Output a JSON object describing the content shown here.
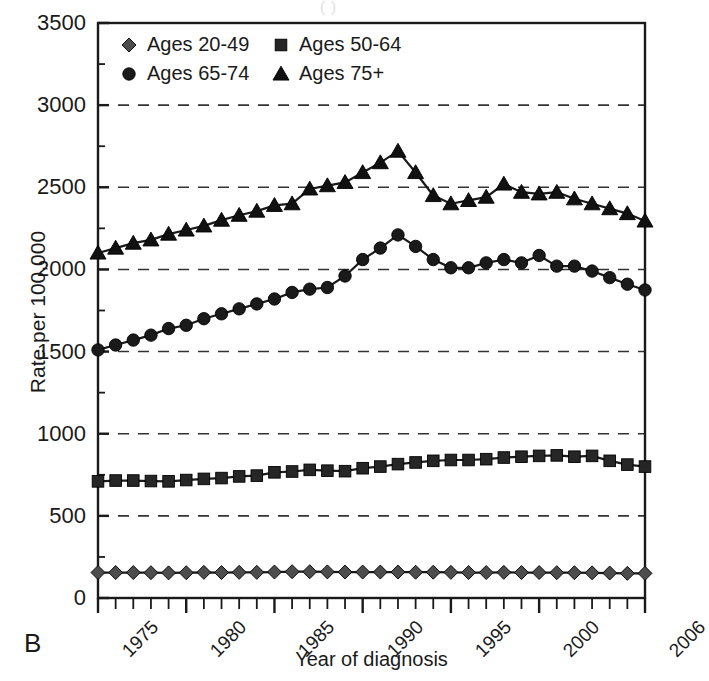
{
  "panel": {
    "label": "B",
    "ghost_title_fragment": "(              )"
  },
  "axes": {
    "x_title": "Year of diagnosis",
    "y_title": "Rate per 100,000",
    "y_ticks": [
      "0",
      "500",
      "1000",
      "1500",
      "2000",
      "2500",
      "3000",
      "3500"
    ],
    "x_ticks": [
      "1975",
      "1980",
      "1985",
      "1990",
      "1995",
      "2000",
      "2006"
    ]
  },
  "legend": {
    "items": [
      {
        "label": "Ages 20-49",
        "marker": "diamond",
        "color": "#4d4d4d"
      },
      {
        "label": "Ages 50-64",
        "marker": "square",
        "color": "#262626"
      },
      {
        "label": "Ages 65-74",
        "marker": "circle",
        "color": "#1a1a1a"
      },
      {
        "label": "Ages 75+",
        "marker": "triangle",
        "color": "#111111"
      }
    ]
  },
  "chart_data": {
    "type": "line",
    "title": "",
    "xlabel": "Year of diagnosis",
    "ylabel": "Rate per 100,000",
    "xlim": [
      1975,
      2006
    ],
    "ylim": [
      0,
      3500
    ],
    "ytick_step": 500,
    "yminor_step": 250,
    "grid": "horizontal-dashed",
    "legend_position": "top-left-inside",
    "x": [
      1975,
      1976,
      1977,
      1978,
      1979,
      1980,
      1981,
      1982,
      1983,
      1984,
      1985,
      1986,
      1987,
      1988,
      1989,
      1990,
      1991,
      1992,
      1993,
      1994,
      1995,
      1996,
      1997,
      1998,
      1999,
      2000,
      2001,
      2002,
      2003,
      2004,
      2005,
      2006
    ],
    "series": [
      {
        "name": "Ages 75+",
        "marker": "triangle",
        "color": "#111111",
        "values": [
          2100,
          2130,
          2160,
          2180,
          2215,
          2240,
          2265,
          2300,
          2330,
          2355,
          2390,
          2400,
          2490,
          2510,
          2530,
          2590,
          2650,
          2720,
          2590,
          2450,
          2400,
          2420,
          2440,
          2520,
          2470,
          2460,
          2470,
          2430,
          2400,
          2370,
          2340,
          2295
        ]
      },
      {
        "name": "Ages 65-74",
        "marker": "circle",
        "color": "#1a1a1a",
        "values": [
          1510,
          1540,
          1570,
          1600,
          1640,
          1660,
          1700,
          1730,
          1760,
          1790,
          1820,
          1860,
          1880,
          1890,
          1960,
          2060,
          2130,
          2210,
          2140,
          2060,
          2010,
          2010,
          2040,
          2060,
          2040,
          2085,
          2020,
          2020,
          1990,
          1950,
          1910,
          1875
        ]
      },
      {
        "name": "Ages 50-64",
        "marker": "square",
        "color": "#262626",
        "values": [
          710,
          715,
          715,
          712,
          710,
          718,
          725,
          730,
          740,
          745,
          765,
          770,
          780,
          775,
          772,
          790,
          800,
          815,
          825,
          835,
          840,
          840,
          845,
          855,
          860,
          865,
          868,
          860,
          865,
          835,
          812,
          800
        ]
      },
      {
        "name": "Ages 20-49",
        "marker": "diamond",
        "color": "#4d4d4d",
        "values": [
          155,
          155,
          155,
          154,
          153,
          154,
          156,
          155,
          156,
          156,
          158,
          160,
          160,
          159,
          158,
          158,
          158,
          158,
          157,
          157,
          156,
          155,
          155,
          156,
          155,
          155,
          154,
          154,
          153,
          152,
          150,
          150
        ]
      }
    ]
  }
}
